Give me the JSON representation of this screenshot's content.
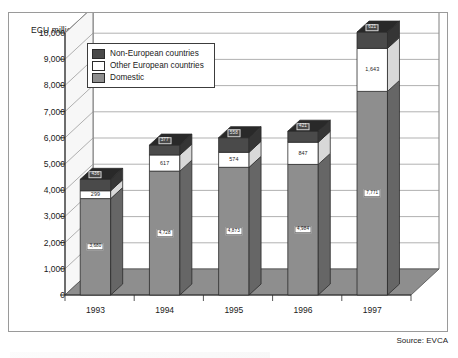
{
  "figure": {
    "axis_title": "ECU million",
    "source_note": "Source: EVCA"
  },
  "legend": {
    "position": "inside-top-left",
    "items": [
      {
        "label": "Non-European countries",
        "color": "#4a4a4a"
      },
      {
        "label": "Other European countries",
        "color": "#ffffff"
      },
      {
        "label": "Domestic",
        "color": "#8e8e8e"
      }
    ]
  },
  "chart_data": {
    "type": "bar",
    "stacked": true,
    "projection": "3d-isometric",
    "title": "",
    "subtitle": "",
    "xlabel": "",
    "ylabel": "ECU million",
    "ylim": [
      0,
      10000
    ],
    "ytick_labels": [
      "10,000",
      "9,000",
      "8,000",
      "7,000",
      "6,000",
      "5,000",
      "4,000",
      "3,000",
      "2,000",
      "1,000",
      "0"
    ],
    "ytick_values": [
      10000,
      9000,
      8000,
      7000,
      6000,
      5000,
      4000,
      3000,
      2000,
      1000,
      0
    ],
    "grid": true,
    "categories": [
      "1993",
      "1994",
      "1995",
      "1996",
      "1997"
    ],
    "series": [
      {
        "name": "Domestic",
        "color": "#8e8e8e",
        "values": [
          3680,
          4728,
          4873,
          4984,
          7771
        ],
        "labels": [
          "3,680",
          "4,728",
          "4,873",
          "4,984",
          "7,771"
        ]
      },
      {
        "name": "Other European countries",
        "color": "#ffffff",
        "values": [
          299,
          617,
          574,
          847,
          1643
        ],
        "labels": [
          "299",
          "617",
          "574",
          "847",
          "1,643"
        ]
      },
      {
        "name": "Non-European countries",
        "color": "#4a4a4a",
        "values": [
          436,
          377,
          558,
          421,
          621
        ],
        "labels": [
          "436",
          "377",
          "558",
          "421",
          "621"
        ]
      }
    ],
    "totals": [
      4415,
      5722,
      6005,
      6252,
      10035
    ]
  }
}
